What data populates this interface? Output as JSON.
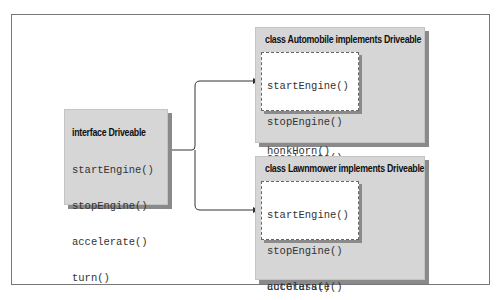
{
  "interface_box": {
    "title": "interface Driveable",
    "methods": [
      "startEngine()",
      "stopEngine()",
      "accelerate()",
      "turn()"
    ]
  },
  "classes": [
    {
      "title": "class Automobile implements Driveable",
      "interface_methods": [
        "startEngine()",
        "stopEngine()",
        "accelerate()",
        "turn()"
      ],
      "own_methods": [
        "honkHorn()",
        "..."
      ]
    },
    {
      "title": "class Lawnmower implements Driveable",
      "interface_methods": [
        "startEngine()",
        "stopEngine()",
        "accelerate()",
        "turn()"
      ],
      "own_methods": [
        "cutGrass()",
        "..."
      ]
    }
  ],
  "colors": {
    "box_fill": "#d6d6d6",
    "shadow": "#8a8a8a",
    "frame": "#777777",
    "arrow": "#333333"
  }
}
